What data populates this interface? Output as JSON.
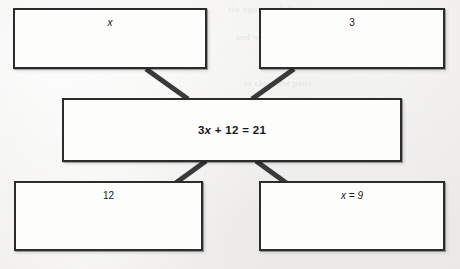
{
  "diagram": {
    "type": "concept-map",
    "ink_color": "#2c2c2e",
    "paper_color": "#f3f2f0",
    "nodes": [
      {
        "id": "top-left",
        "text": "x",
        "position": "top-left"
      },
      {
        "id": "top-right",
        "text": "3",
        "position": "top-right"
      },
      {
        "id": "center",
        "text": "3x + 12 = 21",
        "position": "center"
      },
      {
        "id": "bottom-left",
        "text": "12",
        "position": "bottom-left"
      },
      {
        "id": "bottom-right",
        "text": "x = 9",
        "position": "bottom-right"
      }
    ],
    "connectors": [
      {
        "from": "top-left",
        "to": "center"
      },
      {
        "from": "top-right",
        "to": "center"
      },
      {
        "from": "center",
        "to": "bottom-left"
      },
      {
        "from": "center",
        "to": "bottom-right"
      }
    ]
  },
  "background": {
    "bleed_through_lines": [
      "the equation below",
      "and write each term",
      "in the correct box",
      "to show the parts"
    ]
  }
}
